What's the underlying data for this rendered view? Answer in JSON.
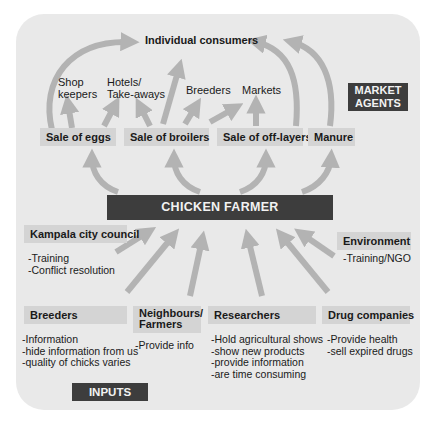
{
  "diagram": {
    "title_node": "CHICKEN FARMER",
    "consumers": "Individual consumers",
    "market_agents_label": "MARKET\nAGENTS",
    "market_agents_line1": "MARKET",
    "market_agents_line2": "AGENTS",
    "inputs_label": "INPUTS",
    "intermediaries": [
      {
        "label_line1": "Shop",
        "label_line2": "keepers"
      },
      {
        "label_line1": "Hotels/",
        "label_line2": "Take-aways"
      },
      {
        "label": "Breeders"
      },
      {
        "label": "Markets"
      }
    ],
    "outputs": [
      {
        "label": "Sale of eggs"
      },
      {
        "label": "Sale of broilers"
      },
      {
        "label": "Sale of off-layers"
      },
      {
        "label": "Manure"
      }
    ],
    "inputs": {
      "kampala": {
        "title": "Kampala city council",
        "items": [
          "-Training",
          "-Conflict resolution"
        ]
      },
      "environment": {
        "title": "Environment",
        "items": [
          "-Training/NGO"
        ]
      },
      "breeders": {
        "title": "Breeders",
        "items": [
          "-Information",
          "-hide information from us",
          "-quality of chicks varies"
        ]
      },
      "neighbours": {
        "title_line1": "Neighbours/",
        "title_line2": "Farmers",
        "items": [
          "-Provide info"
        ]
      },
      "researchers": {
        "title": "Researchers",
        "items": [
          "-Hold agricultural shows",
          "-show new products",
          "-provide information",
          "-are time consuming"
        ]
      },
      "drug_companies": {
        "title": "Drug companies",
        "items": [
          "-Provide health",
          "-sell expired drugs"
        ]
      }
    },
    "colors": {
      "panel": "#e9e9e9",
      "label_box": "#d4d4d4",
      "dark_box": "#3d3d3d",
      "arrow": "#b3b3b3"
    }
  }
}
